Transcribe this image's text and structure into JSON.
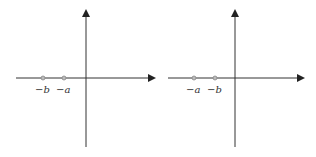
{
  "diagrams": [
    {
      "name": "left-number-line",
      "points": [
        {
          "label": "−b",
          "x": 43
        },
        {
          "label": "−a",
          "x": 64
        }
      ]
    },
    {
      "name": "right-number-line",
      "points": [
        {
          "label": "−a",
          "x": 194
        },
        {
          "label": "−b",
          "x": 215
        }
      ]
    }
  ],
  "colors": {
    "axis": "#333333",
    "point": "#888888"
  }
}
